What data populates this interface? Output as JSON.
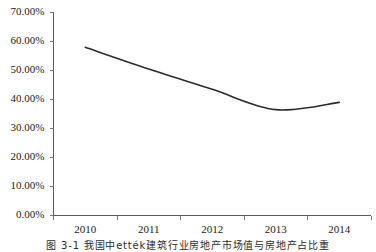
{
  "chart_data": {
    "type": "line",
    "title": "",
    "subtitle": "",
    "xlabel": "",
    "ylabel": "",
    "categories": [
      "2010",
      "2011",
      "2012",
      "2013",
      "2014"
    ],
    "series": [
      {
        "name": "series-1",
        "values": [
          58.0,
          50.5,
          43.5,
          36.5,
          39.0
        ],
        "color": "#2b2b2b",
        "smooth": true,
        "markers": false
      }
    ],
    "ylim": [
      0,
      70
    ],
    "ytick_values": [
      0,
      10,
      20,
      30,
      40,
      50,
      60,
      70
    ],
    "ytick_labels": [
      "0.00%",
      "10.00%",
      "20.00%",
      "30.00%",
      "40.00%",
      "50.00%",
      "60.00%",
      "70.00%"
    ],
    "xtick_labels": [
      "2010",
      "2011",
      "2012",
      "2013",
      "2014"
    ],
    "grid": false,
    "legend": false,
    "legend_position": "none",
    "annotations": []
  },
  "caption": {
    "text": "图 3-1  我国中ették建筑行业房地产市场值与房地产占比重"
  },
  "colors": {
    "axis": "#5a5a5a",
    "tick": "#7a7a7a",
    "line": "#2b2b2b",
    "text": "#1b1b1b",
    "background": "#ffffff"
  }
}
